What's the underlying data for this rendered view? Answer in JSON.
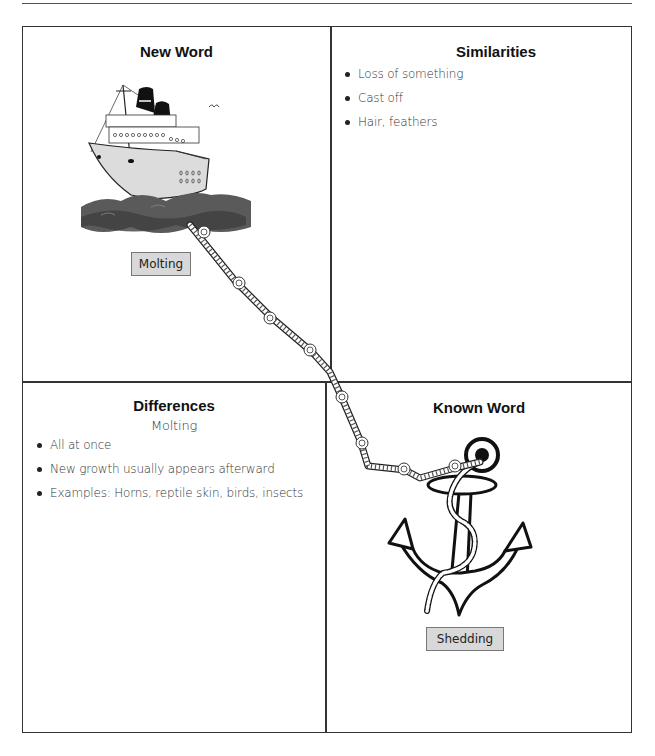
{
  "quadrants": {
    "new_word": {
      "heading": "New Word",
      "word": "Molting",
      "illustration": "ship-icon"
    },
    "similarities": {
      "heading": "Similarities",
      "items": [
        "Loss of something",
        "Cast off",
        "Hair, feathers"
      ]
    },
    "differences": {
      "heading": "Differences",
      "subheading": "Molting",
      "items": [
        "All at once",
        "New growth usually appears afterward",
        "Examples: Horns, reptile skin, birds, insects"
      ]
    },
    "known_word": {
      "heading": "Known Word",
      "word": "Shedding",
      "illustration": "anchor-icon"
    }
  },
  "connector": {
    "type": "rope-icon",
    "from": "new_word",
    "to": "known_word"
  },
  "colors": {
    "border": "#333333",
    "word_box_fill": "#d8d8d8",
    "word_box_border": "#777777",
    "sea": "#555555"
  }
}
